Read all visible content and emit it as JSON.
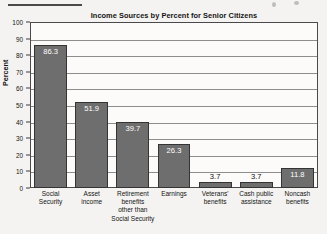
{
  "chart_data": {
    "type": "bar",
    "title": "Income Sources by Percent for Senior Citizens",
    "xlabel": "",
    "ylabel": "Percent",
    "ylim": [
      0,
      100
    ],
    "yticks": [
      0,
      10,
      20,
      30,
      40,
      50,
      60,
      70,
      80,
      90,
      100
    ],
    "grid": true,
    "legend": "none",
    "categories": [
      "Social Security",
      "Asset income",
      "Retirement benefits other than Social Security",
      "Earnings",
      "Veterans' benefits",
      "Cash public assistance",
      "Noncash benefits"
    ],
    "category_lines": [
      [
        "Social",
        "Security"
      ],
      [
        "Asset",
        "income"
      ],
      [
        "Retirement",
        "benefits",
        "other than",
        "Social Security"
      ],
      [
        "Earnings"
      ],
      [
        "Veterans'",
        "benefits"
      ],
      [
        "Cash public",
        "assistance"
      ],
      [
        "Noncash",
        "benefits"
      ]
    ],
    "values": [
      86.3,
      51.9,
      39.7,
      26.3,
      3.7,
      3.7,
      11.8
    ],
    "value_labels": [
      "86.3",
      "51.9",
      "39.7",
      "26.3",
      "3.7",
      "3.7",
      "11.8"
    ],
    "label_position": [
      "inside",
      "inside",
      "inside",
      "inside",
      "above",
      "above",
      "inside"
    ],
    "bar_color": "#6e6e6e",
    "bar_border_color": "#343434",
    "plot_background": "#fcfbfa",
    "grid_color": "#8d8d8d",
    "page_background": "#f4f3f1"
  },
  "y_axis": {
    "tick_labels": [
      "100",
      "90",
      "80",
      "70",
      "60",
      "50",
      "40",
      "30",
      "20",
      "10",
      "0"
    ],
    "title": "Percent"
  }
}
